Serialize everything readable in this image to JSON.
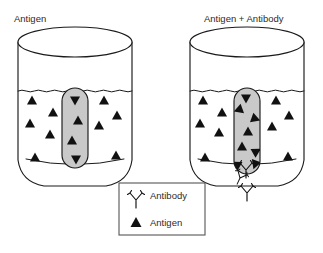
{
  "figure": {
    "background_color": "#ffffff",
    "ink_color": "#111111",
    "gel_fill_color": "#c9c9c9",
    "legend_border_color": "#555555",
    "width": 323,
    "height": 253
  },
  "panels": [
    {
      "id": "left",
      "title": "Antigen",
      "title_x": 14,
      "title_y": 22,
      "vessel": {
        "cx": 75,
        "top_y": 42,
        "bottom_y": 186,
        "half_width": 57,
        "rim_ry": 15,
        "surface_y": 91
      },
      "gel": {
        "x": 62,
        "y": 88,
        "width": 26,
        "height": 80,
        "radius": 13
      },
      "antigens_solution": [
        {
          "x": 32,
          "y": 100,
          "rot": 0
        },
        {
          "x": 53,
          "y": 112,
          "rot": 0
        },
        {
          "x": 30,
          "y": 123,
          "rot": 0
        },
        {
          "x": 50,
          "y": 134,
          "rot": 0
        },
        {
          "x": 35,
          "y": 157,
          "rot": 0
        },
        {
          "x": 104,
          "y": 100,
          "rot": 0
        },
        {
          "x": 117,
          "y": 115,
          "rot": 0
        },
        {
          "x": 99,
          "y": 125,
          "rot": 0
        },
        {
          "x": 116,
          "y": 155,
          "rot": 0
        }
      ],
      "antigens_gel": [
        {
          "x": 75,
          "y": 101,
          "rot": 180
        },
        {
          "x": 78,
          "y": 120,
          "rot": 0
        },
        {
          "x": 72,
          "y": 140,
          "rot": 0
        },
        {
          "x": 76,
          "y": 160,
          "rot": 180
        }
      ],
      "antibodies": [],
      "precipitin": false
    },
    {
      "id": "right",
      "title": "Antigen + Antibody",
      "title_x": 204,
      "title_y": 22,
      "vessel": {
        "cx": 247,
        "top_y": 42,
        "bottom_y": 186,
        "half_width": 57,
        "rim_ry": 15,
        "surface_y": 91
      },
      "gel": {
        "x": 234,
        "y": 88,
        "width": 26,
        "height": 86,
        "radius": 13
      },
      "antigens_solution": [
        {
          "x": 203,
          "y": 100,
          "rot": 0
        },
        {
          "x": 222,
          "y": 112,
          "rot": 0
        },
        {
          "x": 200,
          "y": 123,
          "rot": 0
        },
        {
          "x": 219,
          "y": 132,
          "rot": 0
        },
        {
          "x": 205,
          "y": 157,
          "rot": 0
        },
        {
          "x": 276,
          "y": 100,
          "rot": 0
        },
        {
          "x": 289,
          "y": 115,
          "rot": 0
        },
        {
          "x": 272,
          "y": 126,
          "rot": 0
        },
        {
          "x": 288,
          "y": 156,
          "rot": 0
        }
      ],
      "antigens_gel": [
        {
          "x": 246,
          "y": 99,
          "rot": 180
        },
        {
          "x": 238,
          "y": 110,
          "rot": 250
        },
        {
          "x": 256,
          "y": 119,
          "rot": 110
        },
        {
          "x": 248,
          "y": 131,
          "rot": 0
        },
        {
          "x": 242,
          "y": 146,
          "rot": 0
        },
        {
          "x": 257,
          "y": 151,
          "rot": 60
        },
        {
          "x": 236,
          "y": 164,
          "rot": 300
        },
        {
          "x": 255,
          "y": 165,
          "rot": 200
        }
      ],
      "antibodies": [
        {
          "x": 246,
          "y": 170,
          "scale": 1.0,
          "rot": 0
        },
        {
          "x": 240,
          "y": 178,
          "scale": 0.85,
          "rot": 25
        },
        {
          "x": 247,
          "y": 193,
          "scale": 1.0,
          "rot": 0
        }
      ],
      "precipitin": true
    }
  ],
  "legend": {
    "box": {
      "x": 119,
      "y": 183,
      "width": 86,
      "height": 52
    },
    "items": [
      {
        "symbol": "antibody-glyph",
        "label": "Antibody",
        "symbol_x": 136,
        "symbol_y": 196,
        "label_x": 150,
        "label_y": 199
      },
      {
        "symbol": "antigen-glyph",
        "label": "Antigen",
        "symbol_x": 136,
        "symbol_y": 222,
        "label_x": 150,
        "label_y": 226
      }
    ]
  }
}
